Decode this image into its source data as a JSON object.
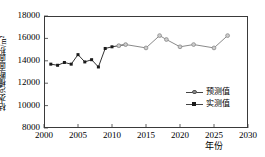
{
  "chart_data": {
    "type": "line",
    "title": "",
    "xlabel": "年份",
    "ylabel": "枯水河槽断面面积/m²",
    "xlim": [
      2000,
      2030
    ],
    "ylim": [
      8000,
      18000
    ],
    "xticks": [
      2000,
      2005,
      2010,
      2015,
      2020,
      2025,
      2030
    ],
    "xtick_labels": [
      "2000",
      "2005",
      "2010",
      "2015",
      "2020",
      "2025",
      "2030"
    ],
    "yticks": [
      8000,
      10000,
      12000,
      14000,
      16000,
      18000
    ],
    "ytick_labels": [
      "8000",
      "10000",
      "12000",
      "14000",
      "16000",
      "18000"
    ],
    "grid": false,
    "legend_position": "lower right",
    "series": [
      {
        "name": "实测值",
        "marker": "filled-square",
        "color": "#1a1a1a",
        "x": [
          2001,
          2002,
          2003,
          2004,
          2005,
          2006,
          2007,
          2008,
          2009,
          2010,
          2011,
          2012
        ],
        "values": [
          13700,
          13600,
          13850,
          13700,
          14550,
          13900,
          14100,
          13450,
          15100,
          15250,
          15350,
          15450
        ]
      },
      {
        "name": "预测值",
        "marker": "open-circle",
        "color": "#8a8a8a",
        "x": [
          2011,
          2012,
          2015,
          2017,
          2018,
          2020,
          2022,
          2025,
          2027
        ],
        "values": [
          15350,
          15450,
          15150,
          16250,
          15900,
          15250,
          15450,
          15150,
          16250
        ]
      }
    ]
  },
  "legend": {
    "items": [
      {
        "label": "预测值"
      },
      {
        "label": "实测值"
      }
    ]
  }
}
